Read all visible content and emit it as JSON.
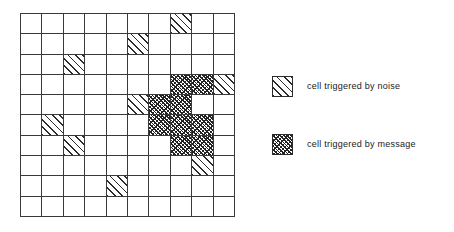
{
  "figure": {
    "title": "",
    "grid": {
      "rows": 10,
      "cols": 10,
      "line_color": "#3a3a3a",
      "background": "#ffffff"
    },
    "legend": {
      "items": [
        {
          "key": "noise",
          "swatch": "diagonal-hatch-sparse",
          "label": "cell  triggered  by  noise"
        },
        {
          "key": "message",
          "swatch": "cross-hatch-dense",
          "label": "cell  triggered  by  message"
        }
      ]
    }
  },
  "chart_data": {
    "type": "heatmap",
    "title": "",
    "xlabel": "",
    "ylabel": "",
    "grid": true,
    "rows": 10,
    "cols": 10,
    "categories_x": [
      "0",
      "1",
      "2",
      "3",
      "4",
      "5",
      "6",
      "7",
      "8",
      "9"
    ],
    "categories_y": [
      "0",
      "1",
      "2",
      "3",
      "4",
      "5",
      "6",
      "7",
      "8",
      "9"
    ],
    "legend_position": "right",
    "state_names": [
      "empty",
      "noise",
      "message"
    ],
    "state_colors": {
      "empty": "#ffffff",
      "noise": "#2b2b2b",
      "message": "#232323"
    },
    "cells": [
      [
        "empty",
        "empty",
        "empty",
        "empty",
        "empty",
        "empty",
        "empty",
        "noise",
        "empty",
        "empty"
      ],
      [
        "empty",
        "empty",
        "empty",
        "empty",
        "empty",
        "noise",
        "empty",
        "empty",
        "empty",
        "empty"
      ],
      [
        "empty",
        "empty",
        "noise",
        "empty",
        "empty",
        "empty",
        "empty",
        "empty",
        "empty",
        "empty"
      ],
      [
        "empty",
        "empty",
        "empty",
        "empty",
        "empty",
        "empty",
        "empty",
        "message",
        "message",
        "noise"
      ],
      [
        "empty",
        "empty",
        "empty",
        "empty",
        "empty",
        "noise",
        "message",
        "message",
        "empty",
        "empty"
      ],
      [
        "empty",
        "noise",
        "empty",
        "empty",
        "empty",
        "empty",
        "message",
        "message",
        "message",
        "empty"
      ],
      [
        "empty",
        "empty",
        "noise",
        "empty",
        "empty",
        "empty",
        "empty",
        "message",
        "message",
        "empty"
      ],
      [
        "empty",
        "empty",
        "empty",
        "empty",
        "empty",
        "empty",
        "empty",
        "empty",
        "noise",
        "empty"
      ],
      [
        "empty",
        "empty",
        "empty",
        "empty",
        "noise",
        "empty",
        "empty",
        "empty",
        "empty",
        "empty"
      ],
      [
        "empty",
        "empty",
        "empty",
        "empty",
        "empty",
        "empty",
        "empty",
        "empty",
        "empty",
        "empty"
      ]
    ],
    "counts": {
      "noise": 8,
      "message": 9,
      "empty": 83
    }
  }
}
